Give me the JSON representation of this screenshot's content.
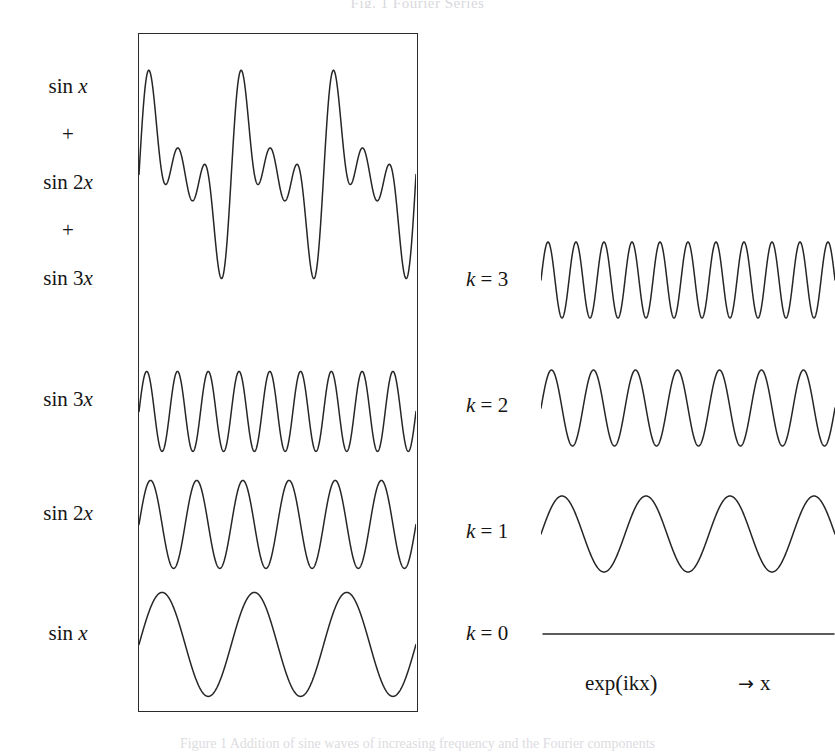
{
  "figure": {
    "header_text": "Fig. 1  Fourier Series",
    "footer_caption": "Figure 1  Addition of sine waves of increasing frequency and the Fourier components"
  },
  "left_panel": {
    "frame": {
      "x": 138,
      "y": 33,
      "width": 280,
      "height": 679
    },
    "labels": [
      {
        "name": "label-sum-sin-x",
        "text": "sin x",
        "term": "sin",
        "arg": "x",
        "y": 87
      },
      {
        "name": "label-plus-1",
        "text": "+",
        "y": 135
      },
      {
        "name": "label-sum-sin-2x",
        "text": "sin 2x",
        "term": "sin 2",
        "arg": "x",
        "y": 183
      },
      {
        "name": "label-plus-2",
        "text": "+",
        "y": 231
      },
      {
        "name": "label-sum-sin-3x",
        "text": "sin 3x",
        "term": "sin 3",
        "arg": "x",
        "y": 279
      },
      {
        "name": "label-sin-3x",
        "text": "sin 3x",
        "term": "sin 3",
        "arg": "x",
        "y": 400
      },
      {
        "name": "label-sin-2x",
        "text": "sin 2x",
        "term": "sin 2",
        "arg": "x",
        "y": 514
      },
      {
        "name": "label-sin-x",
        "text": "sin x",
        "term": "sin",
        "arg": "x",
        "y": 634
      }
    ]
  },
  "right_panel": {
    "labels": [
      {
        "name": "label-k-3",
        "sym": "k",
        "eq": "= 3",
        "value": 3,
        "y": 280
      },
      {
        "name": "label-k-2",
        "sym": "k",
        "eq": "= 2",
        "value": 2,
        "y": 406
      },
      {
        "name": "label-k-1",
        "sym": "k",
        "eq": "= 1",
        "value": 1,
        "y": 532
      },
      {
        "name": "label-k-0",
        "sym": "k",
        "eq": "= 0",
        "value": 0,
        "y": 624
      }
    ],
    "axis_caption": {
      "exp_prefix": "exp",
      "exp_open": "(",
      "exp_arg": "ikx",
      "exp_close": ")",
      "arrow": "→",
      "axis_var": "x"
    }
  },
  "chart_data": {
    "type": "line",
    "xlabel": "x",
    "ylabel": "",
    "grid": false,
    "legend": "none",
    "stroke_color": "#262626",
    "stroke_width": 1.5,
    "panels": [
      {
        "id": "left-frame",
        "framed": true,
        "x_range": [
          0,
          18.8496
        ],
        "x_label": "x",
        "series": [
          {
            "name": "sin x + sin 2x + sin 3x",
            "label": "sin x\n+\nsin 2x\n+\nsin 3x",
            "kind": "sum",
            "components": [
              {
                "amplitude": 1,
                "frequency": 1
              },
              {
                "amplitude": 1,
                "frequency": 2
              },
              {
                "amplitude": 1,
                "frequency": 3
              }
            ],
            "periods_shown": 3,
            "center_y": 175,
            "amplitude_px": 90,
            "peak_count": 3
          },
          {
            "name": "sin 3x",
            "label": "sin 3x",
            "kind": "sine",
            "amplitude": 1,
            "frequency": 3,
            "periods_shown": 9,
            "center_y": 412,
            "amplitude_px": 40
          },
          {
            "name": "sin 2x",
            "label": "sin 2x",
            "kind": "sine",
            "amplitude": 1,
            "frequency": 2,
            "periods_shown": 6,
            "center_y": 525,
            "amplitude_px": 44
          },
          {
            "name": "sin x",
            "label": "sin x",
            "kind": "sine",
            "amplitude": 1,
            "frequency": 1,
            "periods_shown": 3,
            "center_y": 645,
            "amplitude_px": 52
          }
        ]
      },
      {
        "id": "right-basis",
        "framed": false,
        "x_range": [
          0,
          1
        ],
        "x_label": "exp(ikx)",
        "series": [
          {
            "name": "k = 3",
            "label": "k = 3",
            "k": 3,
            "kind": "sine",
            "periods_shown": 10.5,
            "center_y": 280,
            "amplitude_px": 38
          },
          {
            "name": "k = 2",
            "label": "k = 2",
            "k": 2,
            "kind": "sine",
            "periods_shown": 7,
            "center_y": 408,
            "amplitude_px": 38
          },
          {
            "name": "k = 1",
            "label": "k = 1",
            "k": 1,
            "kind": "sine",
            "periods_shown": 3.5,
            "center_y": 534,
            "amplitude_px": 38
          },
          {
            "name": "k = 0",
            "label": "k = 0",
            "k": 0,
            "kind": "constant",
            "periods_shown": 0,
            "center_y": 634,
            "amplitude_px": 0
          }
        ]
      }
    ]
  }
}
